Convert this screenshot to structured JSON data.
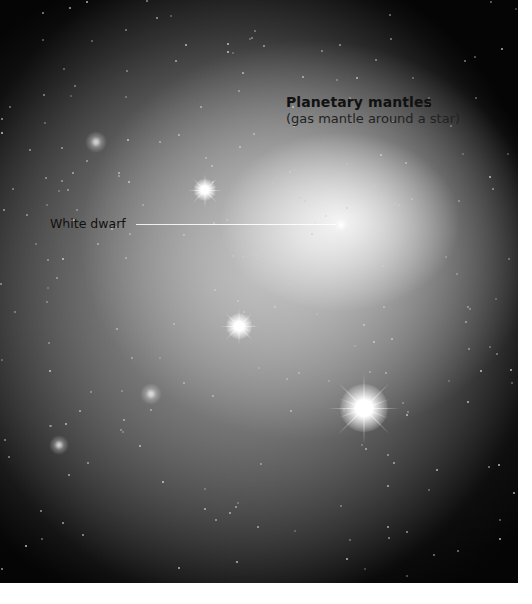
{
  "illustration": {
    "subject": "planetary nebula around a white dwarf star field",
    "labels": {
      "title": "Planetary mantles",
      "subtitle": "(gas mantle around a star)",
      "white_dwarf": "White dwarf"
    },
    "colors": {
      "background": "#050505",
      "nebula_core": "#f2f2f2",
      "label_text": "#111111",
      "page": "#ffffff"
    },
    "bright_stars": [
      {
        "name": "star-upper",
        "x": 205,
        "y": 190,
        "size": 28,
        "style": "spiky"
      },
      {
        "name": "star-middle",
        "x": 239,
        "y": 326,
        "size": 32,
        "style": "spiky"
      },
      {
        "name": "star-lower-right",
        "x": 364,
        "y": 408,
        "size": 60,
        "style": "spiky"
      }
    ],
    "dim_stars": [
      {
        "name": "star-upper-left",
        "x": 96,
        "y": 142,
        "size": 22
      },
      {
        "name": "star-lower-left",
        "x": 151,
        "y": 394,
        "size": 22
      },
      {
        "name": "star-far-lower-left",
        "x": 59,
        "y": 445,
        "size": 20
      }
    ],
    "white_dwarf_position": {
      "x": 341,
      "y": 225
    }
  }
}
